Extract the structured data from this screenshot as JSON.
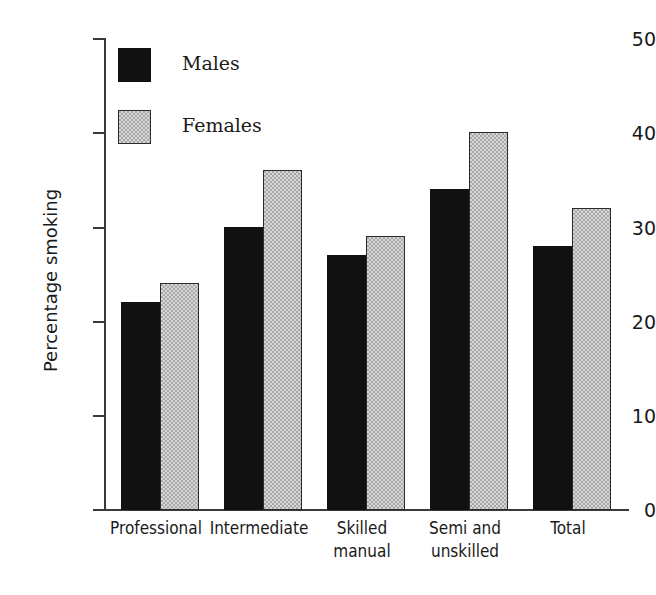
{
  "chart_data": {
    "type": "bar",
    "title": "",
    "subtitle": "",
    "xlabel": "",
    "ylabel": "Percentage smoking",
    "ylim": [
      0,
      50
    ],
    "ytick_labels": [
      "50",
      "40",
      "30",
      "20",
      "10",
      "0"
    ],
    "ytick_values": [
      50,
      40,
      30,
      20,
      10,
      0
    ],
    "grid": false,
    "legend_position": "top-left inside plot",
    "categories": [
      "Professional",
      "Intermediate",
      "Skilled manual",
      "Semi and unskilled",
      "Total"
    ],
    "category_lines": [
      [
        "Professional"
      ],
      [
        "Intermediate"
      ],
      [
        "Skilled",
        "manual"
      ],
      [
        "Semi and",
        "unskilled"
      ],
      [
        "Total"
      ]
    ],
    "series": [
      {
        "name": "Males",
        "color": "#111111",
        "fill": "solid-black",
        "values": [
          22,
          30,
          27,
          34,
          28
        ]
      },
      {
        "name": "Females",
        "color": "#a9a9a9",
        "fill": "checkered-gray",
        "values": [
          24,
          36,
          29,
          40,
          32
        ]
      }
    ],
    "annotations": []
  },
  "legend": {
    "items": [
      {
        "label": "Males",
        "swatch": "males-swatch"
      },
      {
        "label": "Females",
        "swatch": "females-swatch"
      }
    ]
  }
}
